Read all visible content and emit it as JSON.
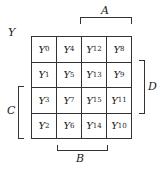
{
  "diagram": {
    "title": "Y",
    "cells": [
      [
        "Y",
        "0"
      ],
      [
        "Y",
        "4"
      ],
      [
        "Y",
        "12"
      ],
      [
        "Y",
        "8"
      ],
      [
        "Y",
        "1"
      ],
      [
        "Y",
        "5"
      ],
      [
        "Y",
        "13"
      ],
      [
        "Y",
        "9"
      ],
      [
        "Y",
        "3"
      ],
      [
        "Y",
        "7"
      ],
      [
        "Y",
        "15"
      ],
      [
        "Y",
        "11"
      ],
      [
        "Y",
        "2"
      ],
      [
        "Y",
        "6"
      ],
      [
        "Y",
        "14"
      ],
      [
        "Y",
        "10"
      ]
    ],
    "labels": {
      "A": "A",
      "B": "B",
      "C": "C",
      "D": "D"
    }
  }
}
